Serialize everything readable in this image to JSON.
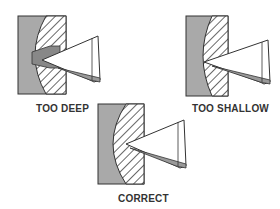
{
  "diagram": {
    "panels": [
      {
        "id": "too-deep",
        "label": "TOO DEEP"
      },
      {
        "id": "too-shallow",
        "label": "TOO SHALLOW"
      },
      {
        "id": "correct",
        "label": "CORRECT"
      }
    ],
    "colors": {
      "workpiece_gray": "#a9a9a9",
      "outline": "#333333",
      "hatch": "#444444",
      "tool_fill": "#ffffff"
    }
  }
}
